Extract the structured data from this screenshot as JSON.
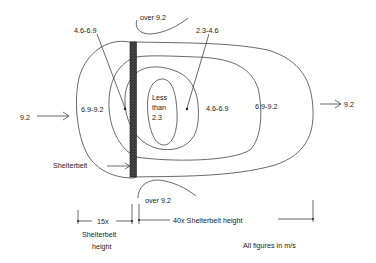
{
  "diagram": {
    "type": "windspeed-contours-around-shelterbelt",
    "labels": {
      "over_top": "over 9.2",
      "over_bottom": "over 9.2",
      "left_pointer": "4.6-6.9",
      "right_pointer": "2.3-4.6",
      "zone_left_outer": "6.9-9.2",
      "core_line1": "Less",
      "core_line2": "than",
      "core_line3": "2.3",
      "zone_mid_right": "4.6-6.9",
      "zone_outer_right": "6.9-9.2",
      "wind_in": "9.2",
      "wind_out": "9.2",
      "shelterbelt": "Shelterbelt",
      "dim_left_top": "15x",
      "dim_left_line2": "Shelterbelt",
      "dim_left_line3": "height",
      "dim_right": "40x Shelterbelt height",
      "units_note": "All figures in m/s"
    },
    "colors": {
      "ink": "#2a2a2a",
      "shelterbelt_fill": "#3a3a3a",
      "background": "#ffffff"
    }
  }
}
